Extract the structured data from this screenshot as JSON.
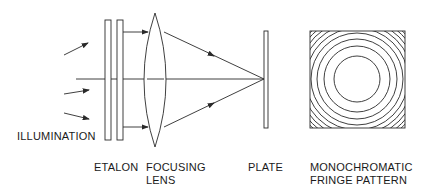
{
  "diagram": {
    "colors": {
      "line": "#2a2a2a",
      "background": "#ffffff"
    },
    "labels": {
      "illumination": "ILLUMINATION",
      "etalon": "ETALON",
      "focusing_lens_1": "FOCUSING",
      "focusing_lens_2": "LENS",
      "plate": "PLATE",
      "fringe_1": "MONOCHROMATIC",
      "fringe_2": "FRINGE PATTERN"
    },
    "components": [
      "illumination rays",
      "etalon (two parallel plates)",
      "focusing lens",
      "plate",
      "monochromatic fringe pattern (concentric rings)"
    ]
  }
}
